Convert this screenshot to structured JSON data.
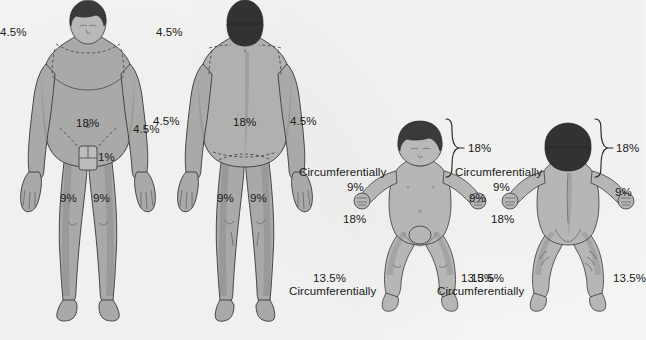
{
  "figures": [
    {
      "id": "adult-anterior",
      "name": "Adult anterior",
      "labels": [
        {
          "key": "head",
          "text": "4.5%"
        },
        {
          "key": "arm_left",
          "text": "4.5%"
        },
        {
          "key": "arm_right",
          "text": "4.5%"
        },
        {
          "key": "trunk",
          "text": "18%"
        },
        {
          "key": "genitalia",
          "text": "1%"
        },
        {
          "key": "leg_left",
          "text": "9%"
        },
        {
          "key": "leg_right",
          "text": "9%"
        }
      ]
    },
    {
      "id": "adult-posterior",
      "name": "Adult posterior",
      "labels": [
        {
          "key": "head",
          "text": "4.5%"
        },
        {
          "key": "arm_left",
          "text": "4.5%"
        },
        {
          "key": "arm_right",
          "text": "4.5%"
        },
        {
          "key": "trunk",
          "text": "18%"
        },
        {
          "key": "leg_left",
          "text": "9%"
        },
        {
          "key": "leg_right",
          "text": "9%"
        }
      ]
    },
    {
      "id": "infant-anterior",
      "name": "Infant anterior",
      "labels": [
        {
          "key": "head_brace",
          "text": "18%"
        },
        {
          "key": "head_circ",
          "text": "Circumferentially"
        },
        {
          "key": "arm_left",
          "text": "9%"
        },
        {
          "key": "arm_right",
          "text": "9%"
        },
        {
          "key": "trunk",
          "text": "18%"
        },
        {
          "key": "leg_left",
          "text": "13.5%"
        },
        {
          "key": "leg_left_circ",
          "text": "Circumferentially"
        },
        {
          "key": "leg_right",
          "text": "13.5%"
        }
      ]
    },
    {
      "id": "infant-posterior",
      "name": "Infant posterior",
      "labels": [
        {
          "key": "head_brace",
          "text": "18%"
        },
        {
          "key": "head_circ",
          "text": "Circumferentially"
        },
        {
          "key": "arm_left",
          "text": "9%"
        },
        {
          "key": "arm_right",
          "text": "9%"
        },
        {
          "key": "trunk",
          "text": "18%"
        },
        {
          "key": "leg_left",
          "text": "13.5%"
        },
        {
          "key": "leg_left_circ",
          "text": "Circumferentially"
        },
        {
          "key": "leg_right",
          "text": "13.5%"
        }
      ]
    }
  ],
  "colors": {
    "background": "#f5f5f3",
    "skin": "#a9aaa8",
    "hair": "#3a3a3c",
    "outline": "#37383a",
    "text": "#18181a"
  }
}
